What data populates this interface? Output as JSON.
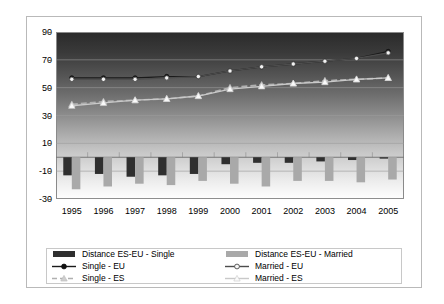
{
  "chart_data": {
    "type": "bar",
    "title": "",
    "xlabel": "",
    "ylabel": "",
    "categories": [
      "1995",
      "1996",
      "1997",
      "1998",
      "1999",
      "2000",
      "2001",
      "2002",
      "2003",
      "2004",
      "2005"
    ],
    "ylim": [
      -30,
      90
    ],
    "yticks": [
      90,
      70,
      50,
      30,
      10,
      -10,
      -30
    ],
    "grid": true,
    "legend_position": "bottom",
    "series": [
      {
        "name": "Distance ES-EU - Single",
        "type": "bar",
        "color": "#2f2f2f",
        "values": [
          -13,
          -12,
          -14,
          -13,
          -12,
          -5,
          -4,
          -4,
          -3,
          -2,
          -1
        ]
      },
      {
        "name": "Distance ES-EU - Married",
        "type": "bar",
        "color": "#a9a9a9",
        "values": [
          -23,
          -21,
          -19,
          -20,
          -17,
          -19,
          -21,
          -17,
          -17,
          -18,
          -16
        ]
      },
      {
        "name": "Single - EU",
        "type": "line",
        "color": "#1a1a1a",
        "marker": "circle-filled",
        "values": [
          57,
          57,
          57,
          58,
          58,
          62,
          65,
          67,
          69,
          71,
          76
        ]
      },
      {
        "name": "Married - EU",
        "type": "line",
        "color": "#4d4d4d",
        "marker": "circle-open",
        "values": [
          56,
          56,
          56,
          57,
          58,
          62,
          65,
          67,
          69,
          71,
          75
        ]
      },
      {
        "name": "Single - ES",
        "type": "line",
        "color": "#b0b0b0",
        "marker": "triangle-filled",
        "values": [
          38,
          40,
          41,
          42,
          44,
          50,
          52,
          53,
          55,
          56,
          57
        ]
      },
      {
        "name": "Married - ES",
        "type": "line",
        "color": "#c9c9c9",
        "marker": "triangle-open",
        "values": [
          37,
          39,
          41,
          42,
          44,
          49,
          51,
          53,
          54,
          56,
          57
        ]
      }
    ]
  },
  "legend": {
    "items": [
      {
        "label": "Distance ES-EU - Single",
        "marker": "bar-dark"
      },
      {
        "label": "Distance ES-EU - Married",
        "marker": "bar-gray"
      },
      {
        "label": "Single - EU",
        "marker": "line-circle-filled"
      },
      {
        "label": "Married - EU",
        "marker": "line-circle-open"
      },
      {
        "label": "Single - ES",
        "marker": "line-triangle-filled"
      },
      {
        "label": "Married - ES",
        "marker": "line-triangle-open"
      }
    ]
  }
}
